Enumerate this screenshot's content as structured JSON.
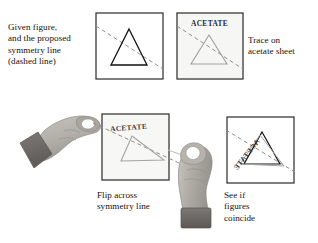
{
  "figure": {
    "background_color": "#ffffff",
    "ink_color": "#1a1a1a",
    "dashed_line_color": "#8c8c8c",
    "acetate_tint": "#f6f6f4",
    "hand_skin_color": "#b3b0aa",
    "hand_cuff_color": "#6e6b68"
  },
  "captions": {
    "given": "Given figure,\nand the proposed\nsymmetry line\n(dashed line)",
    "trace": "Trace on\nacetate sheet",
    "flip": "Flip across\nsymmetry line",
    "coincide": "See if\nfigures\ncoincide"
  },
  "panels": {
    "given": {
      "name": "Given figure panel",
      "label": "",
      "triangle_stroke": "#111111",
      "dashed_line": true
    },
    "acetate": {
      "name": "Traced acetate panel",
      "label": "ACETATE",
      "triangle_stroke": "#9a9a9a",
      "dashed_line": true
    },
    "flipped": {
      "name": "Flipped acetate panel",
      "label": "ACETATE",
      "triangle_stroke": "#9a9a9a",
      "dashed_line": true
    },
    "overlay": {
      "name": "Overlaid figures panel",
      "label": "ACETATE",
      "triangle_stroke": "#111111",
      "dashed_line": true
    }
  },
  "icons": {
    "hand_left": "hand-pinching-left",
    "hand_right": "hand-pinching-up"
  }
}
